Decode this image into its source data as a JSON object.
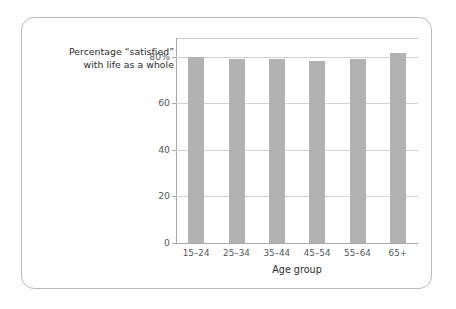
{
  "caption": {
    "line1": "Percentage “satisfied”",
    "line2": "with life as a whole"
  },
  "chart_data": {
    "type": "bar",
    "title": "Percentage “satisfied” with life as a whole",
    "xlabel": "Age group",
    "ylabel": "",
    "categories": [
      "15–24",
      "25–34",
      "35–44",
      "45–54",
      "55–64",
      "65+"
    ],
    "values": [
      80,
      79,
      79,
      78,
      79,
      81.5
    ],
    "ylim": [
      0,
      88
    ],
    "yticks": [
      0,
      20,
      40,
      60,
      80
    ],
    "ytick_labels": [
      "0",
      "20",
      "40",
      "60",
      "80%"
    ],
    "grid": true,
    "legend": "none",
    "bar_color": "#b2b2b2",
    "gridline_color": "#d2d2d2",
    "axis_color": "#a8a8a8",
    "frame_color": "#b9b9b9",
    "text_color": "#2b2b2b",
    "tick_text_color": "#55595c"
  }
}
